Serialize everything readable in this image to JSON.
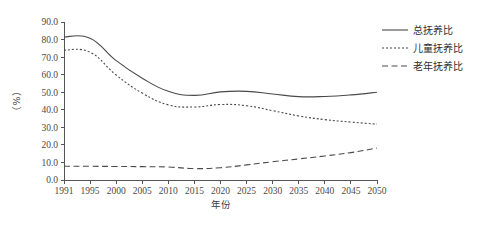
{
  "figure": {
    "background_color": "#ffffff",
    "line_color": "#4a4a4a",
    "axis_color": "#555555"
  },
  "axes": {
    "ylabel": "（%）",
    "xlabel": "年份",
    "yticks": [
      "0.0",
      "10.0",
      "20.0",
      "30.0",
      "40.0",
      "50.0",
      "60.0",
      "70.0",
      "80.0",
      "90.0"
    ],
    "xticks": [
      "1991",
      "1995",
      "2000",
      "2005",
      "2010",
      "2015",
      "2020",
      "2025",
      "2030",
      "2035",
      "2040",
      "2045",
      "2050"
    ]
  },
  "legend": {
    "items": [
      {
        "label": "总抚养比",
        "style": "solid"
      },
      {
        "label": "儿童抚养比",
        "style": "dotted"
      },
      {
        "label": "老年抚养比",
        "style": "dashed"
      }
    ]
  },
  "chart_data": {
    "type": "line",
    "title": "",
    "xlabel": "年份",
    "ylabel": "（%）",
    "ylim": [
      0,
      90
    ],
    "yticks": [
      0,
      10,
      20,
      30,
      40,
      50,
      60,
      70,
      80,
      90
    ],
    "grid": false,
    "legend_position": "right",
    "x": [
      1991,
      1995,
      2000,
      2005,
      2010,
      2015,
      2020,
      2025,
      2030,
      2035,
      2040,
      2045,
      2050
    ],
    "series": [
      {
        "name": "总抚养比",
        "style": "solid",
        "values": [
          81.5,
          80.8,
          68.0,
          58.0,
          50.5,
          48.2,
          50.2,
          50.5,
          49.0,
          47.5,
          47.6,
          48.5,
          50.0
        ]
      },
      {
        "name": "儿童抚养比",
        "style": "dotted",
        "values": [
          74.0,
          72.8,
          59.8,
          49.5,
          42.8,
          41.6,
          43.0,
          42.3,
          39.5,
          36.5,
          34.4,
          33.0,
          31.8
        ]
      },
      {
        "name": "老年抚养比",
        "style": "dashed",
        "values": [
          7.8,
          7.8,
          7.7,
          7.6,
          7.4,
          6.5,
          7.0,
          8.6,
          10.4,
          12.0,
          13.7,
          15.6,
          18.2
        ]
      }
    ]
  }
}
